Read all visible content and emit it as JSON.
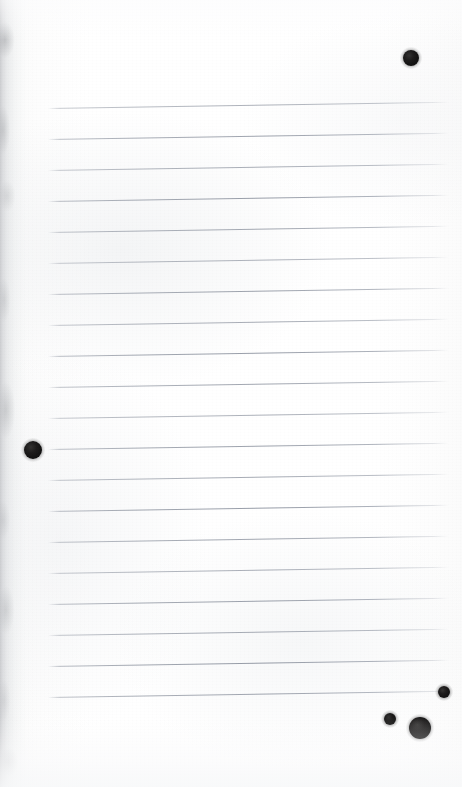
{
  "document": {
    "kind": "scanned-notebook-page",
    "page_width": 462,
    "page_height": 787,
    "paper_color": "#fdfdfd",
    "background_color": "#ffffff",
    "description": "Blank ruled notebook page, scanned, with dark round ink blots",
    "orientation": "portrait",
    "text_content": "",
    "is_blank": true
  },
  "ruling": {
    "line_color": "#8f95a1",
    "line_count": 20,
    "first_line_y": 108,
    "line_spacing": 31,
    "line_left_x": 48,
    "line_right_x": 449,
    "line_thickness": 1,
    "slant_degrees": -0.9,
    "margin_line_visible": false,
    "lines_y": [
      108,
      139,
      170,
      201,
      232,
      263,
      294,
      325,
      356,
      387,
      418,
      449,
      480,
      511,
      542,
      573,
      604,
      635,
      666,
      697
    ]
  },
  "ink_blots": [
    {
      "name": "blot-top-right",
      "x": 411,
      "y": 58,
      "radius": 8,
      "color": "#0b0a0a"
    },
    {
      "name": "blot-left-middle",
      "x": 33,
      "y": 450,
      "radius": 9,
      "color": "#0b0a0a"
    },
    {
      "name": "blot-bottom-upper",
      "x": 444,
      "y": 692,
      "radius": 6,
      "color": "#0b0a0a"
    },
    {
      "name": "blot-bottom-left",
      "x": 390,
      "y": 719,
      "radius": 6,
      "color": "#0b0a0a"
    },
    {
      "name": "blot-bottom-large",
      "x": 420,
      "y": 728,
      "radius": 11,
      "color": "#0b0a0a"
    }
  ],
  "scan_artifacts": {
    "left_edge_shadow": true,
    "left_edge_shadow_width": 34,
    "left_edge_shadow_color": "#96989c",
    "paper_grain": true,
    "bottom_fade": true
  }
}
